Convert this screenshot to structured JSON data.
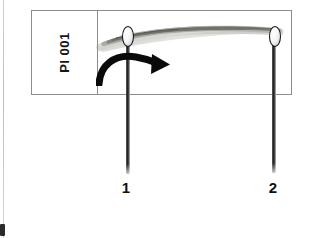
{
  "figure": {
    "type": "scanned-evidence-photograph",
    "background_color": "#ffffff",
    "width": 316,
    "height": 238
  },
  "label_box": {
    "tag_id": "Pl 001",
    "orientation": "rotated-90-ccw",
    "border_color": "#8c8c8c"
  },
  "specimen": {
    "name": "fiber-strand",
    "color": "#8d8d85",
    "description": "gray fibrous strand stretched between two pin heads"
  },
  "pins": [
    {
      "label": "1",
      "position": "left",
      "color": "#1d1d1d"
    },
    {
      "label": "2",
      "position": "right",
      "color": "#1d1d1d"
    }
  ],
  "annotation_arrow": {
    "name": "rotation-arrow",
    "direction": "clockwise-right",
    "color": "#0a0a0a"
  }
}
